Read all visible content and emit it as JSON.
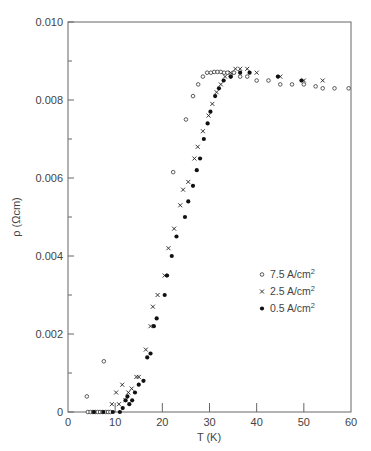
{
  "chart_data": {
    "type": "scatter",
    "title": "",
    "xlabel": "T (K)",
    "ylabel": "ρ  (Ωcm)",
    "xlim": [
      0,
      60
    ],
    "ylim": [
      0,
      0.01
    ],
    "xticks": [
      0,
      10,
      20,
      30,
      40,
      50,
      60
    ],
    "xtick_labels": [
      "0",
      "10",
      "20",
      "30",
      "40",
      "50",
      "60"
    ],
    "yticks": [
      0,
      0.002,
      0.004,
      0.006,
      0.008,
      0.01
    ],
    "ytick_labels": [
      "0",
      "0.002",
      "0.004",
      "0.006",
      "0.008",
      "0.010"
    ],
    "grid": false,
    "legend_position": "center-right",
    "series": [
      {
        "name": "7.5 A/cm²",
        "legend_main": "7.5  A/cm",
        "legend_sup": "2",
        "marker": "open-circle",
        "x": [
          4.0,
          4.2,
          4.8,
          5.3,
          5.8,
          6.3,
          6.8,
          7.3,
          7.6,
          8.0,
          8.5,
          9.0,
          22.3,
          25.0,
          26.5,
          27.6,
          28.6,
          29.5,
          30.3,
          31.0,
          31.7,
          32.4,
          33.1,
          33.8,
          34.5,
          35.2,
          36.5,
          38.0,
          40.0,
          42.5,
          45.0,
          47.5,
          50.0,
          52.5,
          54.0,
          56.5,
          59.5
        ],
        "y": [
          0.0004,
          0.0,
          0.0,
          0.0,
          0.0,
          0.0,
          0.0,
          0.0,
          0.0013,
          0.0,
          0.0,
          0.0,
          0.00615,
          0.0075,
          0.0081,
          0.0084,
          0.0086,
          0.0087,
          0.0087,
          0.00872,
          0.00872,
          0.00872,
          0.0087,
          0.0087,
          0.0086,
          0.0087,
          0.0086,
          0.0086,
          0.0085,
          0.0085,
          0.0084,
          0.0084,
          0.0084,
          0.00835,
          0.0083,
          0.0083,
          0.0083
        ]
      },
      {
        "name": "2.5 A/cm²",
        "legend_main": "2.5  A/cm",
        "legend_sup": "2",
        "marker": "cross",
        "x": [
          9.3,
          10.2,
          10.8,
          11.5,
          12.2,
          12.8,
          13.5,
          14.5,
          15.0,
          16.5,
          17.5,
          18.0,
          19.0,
          20.5,
          21.3,
          22.5,
          23.8,
          24.4,
          25.5,
          26.8,
          27.5,
          28.6,
          29.8,
          30.6,
          31.5,
          32.4,
          33.3,
          34.5,
          35.5,
          36.5,
          38.0,
          40.0,
          45.0,
          50.0,
          54.0
        ],
        "y": [
          0.0002,
          0.0005,
          0.0002,
          0.0007,
          0.0003,
          0.0005,
          0.0006,
          0.0009,
          0.0009,
          0.0016,
          0.0022,
          0.0027,
          0.003,
          0.0035,
          0.0042,
          0.0047,
          0.0053,
          0.0057,
          0.0059,
          0.0065,
          0.0068,
          0.0072,
          0.0076,
          0.0079,
          0.0082,
          0.0084,
          0.0086,
          0.0087,
          0.0088,
          0.0088,
          0.0088,
          0.0087,
          0.0086,
          0.0085,
          0.0085
        ]
      },
      {
        "name": "0.5 A/cm²",
        "legend_main": "0.5  A/cm",
        "legend_sup": "2",
        "marker": "filled-circle",
        "x": [
          5.5,
          7.5,
          9.5,
          11.0,
          11.6,
          12.2,
          12.6,
          13.0,
          13.6,
          14.2,
          15.0,
          16.0,
          16.8,
          17.5,
          18.2,
          18.8,
          20.5,
          21.0,
          22.0,
          23.0,
          24.8,
          25.5,
          26.5,
          27.3,
          28.0,
          28.8,
          29.6,
          30.2,
          31.2,
          32.0,
          33.0,
          34.5,
          36.5,
          38.5,
          44.5,
          49.5
        ],
        "y": [
          0.0,
          0.0,
          0.0,
          0.0,
          0.0001,
          0.0003,
          0.0004,
          0.0002,
          0.0003,
          0.0005,
          0.0007,
          0.0008,
          0.0014,
          0.0015,
          0.0022,
          0.0024,
          0.003,
          0.0035,
          0.004,
          0.0045,
          0.005,
          0.0054,
          0.0058,
          0.0062,
          0.0065,
          0.007,
          0.0074,
          0.0077,
          0.0081,
          0.0083,
          0.0085,
          0.0086,
          0.0087,
          0.0087,
          0.0086,
          0.0085
        ]
      }
    ]
  },
  "caption_fragment": "."
}
